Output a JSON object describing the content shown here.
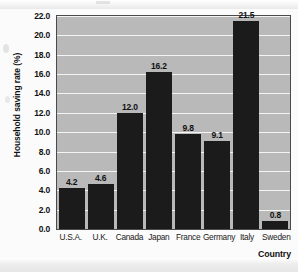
{
  "chart_data": {
    "type": "bar",
    "title": "",
    "subtitle": "",
    "xlabel": "Country",
    "ylabel": "Household saving rate (%)",
    "categories": [
      "U.S.A.",
      "U.K.",
      "Canada",
      "Japan",
      "France",
      "Germany",
      "Italy",
      "Sweden"
    ],
    "values": [
      4.2,
      4.6,
      12.0,
      16.2,
      9.8,
      9.1,
      21.5,
      0.8
    ],
    "value_labels": [
      "4.2",
      "4.6",
      "12.0",
      "16.2",
      "9.8",
      "9.1",
      "21.5",
      "0.8"
    ],
    "ylim": [
      0.0,
      22.0
    ],
    "ytick_labels": [
      "22.0",
      "20.0",
      "18.0",
      "16.0",
      "14.0",
      "12.0",
      "10.0",
      "8.0",
      "6.0",
      "4.0",
      "2.0",
      "0.0"
    ],
    "ytick_values": [
      22.0,
      20.0,
      18.0,
      16.0,
      14.0,
      12.0,
      10.0,
      8.0,
      6.0,
      4.0,
      2.0,
      0.0
    ],
    "ytick_step": 2.0,
    "grid": true,
    "grid_orientation": "horizontal",
    "legend": false,
    "legend_position": "none",
    "series": [
      {
        "name": "Household saving rate",
        "values": [
          4.2,
          4.6,
          12.0,
          16.2,
          9.8,
          9.1,
          21.5,
          0.8
        ]
      }
    ],
    "colors": {
      "bar": "#1b1b1b",
      "plot_background": "#b9b9b9",
      "gridline": "#f4f4f4",
      "axis_border": "#4a4a4a",
      "page_background": "#fbfbfb",
      "text": "#111111"
    }
  }
}
